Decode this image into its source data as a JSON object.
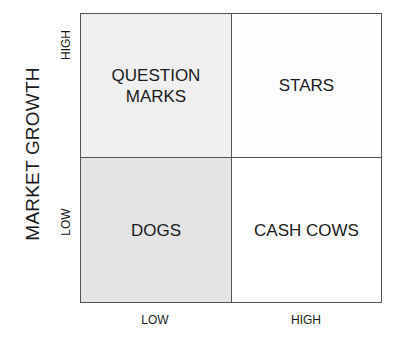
{
  "diagram": {
    "type": "2x2 matrix",
    "y_axis": {
      "label": "MARKET GROWTH",
      "ticks": {
        "high": "HIGH",
        "low": "LOW"
      }
    },
    "x_axis": {
      "label": "",
      "ticks": {
        "low": "LOW",
        "high": "HIGH"
      }
    },
    "quadrants": {
      "top_left": {
        "label": "QUESTION\nMARKS",
        "fill": "#efefef"
      },
      "top_right": {
        "label": "STARS",
        "fill": "#fdfdfd"
      },
      "bottom_left": {
        "label": "DOGS",
        "fill": "#e4e4e4"
      },
      "bottom_right": {
        "label": "CASH COWS",
        "fill": "#ffffff"
      }
    },
    "border_color": "#555555"
  }
}
